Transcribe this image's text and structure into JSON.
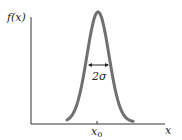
{
  "chart_data": {
    "type": "line",
    "title": "",
    "xlabel": "x",
    "ylabel": "f(x)",
    "x_tick_labels": [
      "x0"
    ],
    "annotations": [
      "2σ"
    ],
    "series": [
      {
        "name": "Gaussian f(x)",
        "shape": "gaussian",
        "center": "x0",
        "width_label": "2σ"
      }
    ],
    "grid": false
  },
  "labels": {
    "ylabel": "f(x)",
    "xlabel": "x",
    "x0_base": "x",
    "x0_sub": "0",
    "width": "2σ"
  },
  "colors": {
    "curve": "#707070",
    "axis": "#333333"
  }
}
